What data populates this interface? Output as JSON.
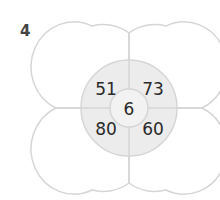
{
  "question_number": "4",
  "diagram": {
    "center_value": "6",
    "quadrants": {
      "top_left": "51",
      "top_right": "73",
      "bottom_left": "80",
      "bottom_right": "60"
    },
    "colors": {
      "stroke": "#d6d6d6",
      "inner_fill": "#ececec",
      "center_fill": "#f2f2f2"
    }
  }
}
